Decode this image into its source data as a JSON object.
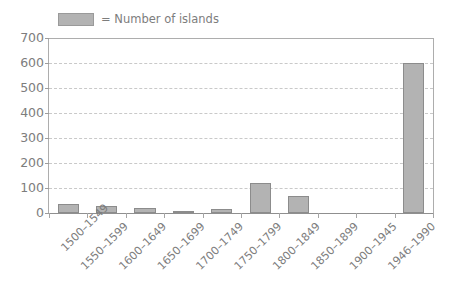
{
  "legend": {
    "swatch_color": "#b3b3b3",
    "label": "= Number of islands"
  },
  "axis": {
    "y_ticks": [
      "700",
      "600",
      "500",
      "400",
      "300",
      "200",
      "100",
      "0"
    ]
  },
  "chart_data": {
    "type": "bar",
    "title": "",
    "xlabel": "",
    "ylabel": "",
    "ylim": [
      0,
      700
    ],
    "ytick_step": 100,
    "grid": true,
    "legend_position": "top-left",
    "categories": [
      "1500–1549",
      "1550–1599",
      "1600–1649",
      "1650–1699",
      "1700–1749",
      "1750–1799",
      "1800–1849",
      "1850–1899",
      "1900–1945",
      "1946–1990"
    ],
    "series": [
      {
        "name": "Number of islands",
        "color": "#b3b3b3",
        "values": [
          35,
          30,
          22,
          10,
          15,
          120,
          68,
          2,
          1,
          600
        ]
      }
    ]
  }
}
